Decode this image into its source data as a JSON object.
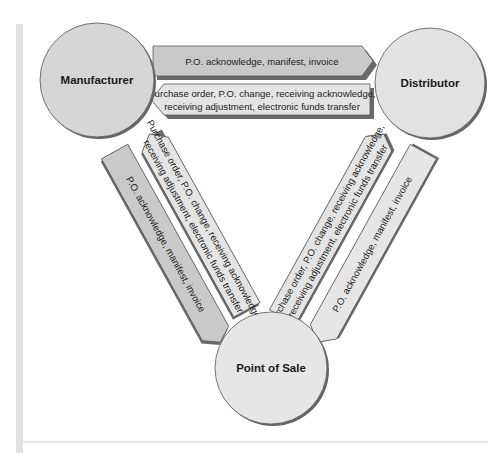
{
  "colors": {
    "circle_fill": "#d8d8d8",
    "circle_fill_light": "#e6e6e6",
    "arrow_dark": "#c8c8c8",
    "arrow_light": "#e4e4e4",
    "stroke": "#555555",
    "shadow": "#6a6a6a",
    "frame": "#e2e2e2"
  },
  "nodes": {
    "manufacturer": {
      "label": "Manufacturer"
    },
    "distributor": {
      "label": "Distributor"
    },
    "point_of_sale": {
      "label": "Point of Sale"
    }
  },
  "flows": {
    "mfr_to_dist": {
      "line1": "P.O. acknowledge, manifest, invoice"
    },
    "dist_to_mfr": {
      "line1": "Purchase order, P.O. change, receiving acknowledge,",
      "line2": "receiving adjustment, electronic funds transfer"
    },
    "mfr_to_pos": {
      "line1": "P.O. acknowledge, manifest, invoice"
    },
    "pos_to_mfr": {
      "line1": "Purchase order, P.O. change, receiving acknowledge,",
      "line2": "receiving adjustment, electronic funds transfer"
    },
    "pos_to_dist": {
      "line1": "Purchase order, P.O. change, receiving acknowledge,",
      "line2": "receiving adjustment, electronic funds transfer"
    },
    "dist_to_pos": {
      "line1": "P.O. acknowledge, manifest, invoice"
    }
  }
}
